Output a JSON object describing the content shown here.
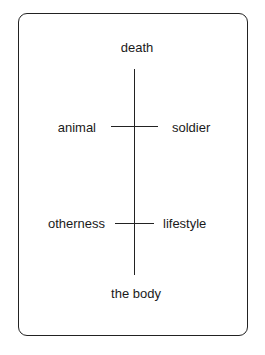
{
  "diagram": {
    "type": "semiotic-square-cross",
    "vertical_axis": {
      "top": "death",
      "bottom": "the body"
    },
    "upper_cross": {
      "left": "animal",
      "right": "soldier"
    },
    "lower_cross": {
      "left": "otherness",
      "right": "lifestyle"
    }
  },
  "colors": {
    "line": "#222222",
    "text": "#1a1a1a",
    "background": "#ffffff"
  }
}
